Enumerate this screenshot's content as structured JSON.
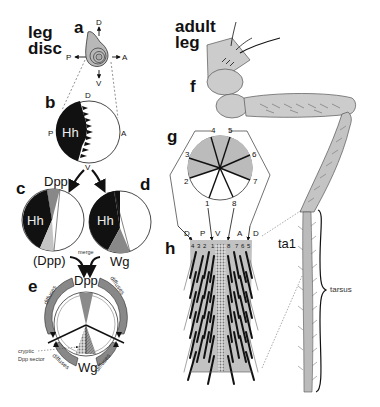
{
  "titles": {
    "leg_disc_line1": "leg",
    "leg_disc_line2": "disc",
    "adult_leg_line1": "adult",
    "adult_leg_line2": "leg"
  },
  "panels": {
    "a": "a",
    "b": "b",
    "c": "c",
    "d": "d",
    "e": "e",
    "f": "f",
    "g": "g",
    "h": "h"
  },
  "axes": {
    "dorsal": "D",
    "ventral": "V",
    "anterior": "A",
    "posterior": "P"
  },
  "labels": {
    "hh": "Hh",
    "dpp": "Dpp",
    "dpp_paren": "(Dpp)",
    "wg": "Wg",
    "merge": "merge",
    "diffuses": "diffuses",
    "cryptic_line1": "cryptic",
    "cryptic_line2": "Dpp sector",
    "ta1": "ta1",
    "tarsus": "tarsus"
  },
  "panel_g": {
    "sector_numbers": [
      "1",
      "2",
      "3",
      "4",
      "5",
      "6",
      "7",
      "8"
    ],
    "arrow_labels": [
      "D",
      "P",
      "V",
      "A",
      "D"
    ]
  },
  "panel_h": {
    "row_numbers": [
      "4",
      "3",
      "2",
      "1",
      "8",
      "7",
      "6",
      "5"
    ]
  },
  "colors": {
    "black": "#111111",
    "gray_dark": "#8c8c8c",
    "gray_mid": "#b4b4b4",
    "gray_light": "#c8c8c8",
    "leg_fill": "#cccccc",
    "line": "#222222"
  }
}
